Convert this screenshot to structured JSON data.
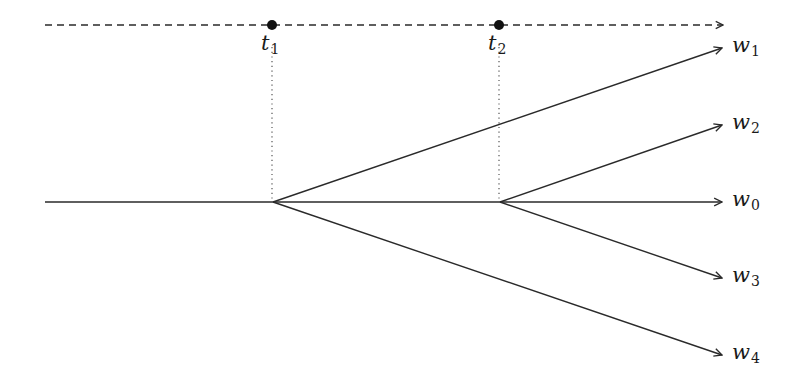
{
  "diagram": {
    "type": "branching-timeline",
    "colors": {
      "stroke": "#2a2a2a",
      "background": "#ffffff",
      "dot": "#111111"
    },
    "timeline": {
      "style": "dashed",
      "y": 25,
      "x_start": 45,
      "x_end": 723,
      "events": [
        {
          "id": "t1",
          "base": "t",
          "sub": "1",
          "x": 272
        },
        {
          "id": "t2",
          "base": "t",
          "sub": "2",
          "x": 499
        }
      ]
    },
    "trunk": {
      "x_start": 45,
      "x_end": 273,
      "y": 202
    },
    "branch_points": [
      {
        "id": "b1",
        "x": 273,
        "y": 202,
        "linked_event": "t1"
      },
      {
        "id": "b2",
        "x": 500,
        "y": 202,
        "linked_event": "t2"
      }
    ],
    "branches": [
      {
        "id": "w1",
        "base": "w",
        "sub": "1",
        "from": "b1",
        "x_end": 722,
        "y_end": 48
      },
      {
        "id": "w2",
        "base": "w",
        "sub": "2",
        "from": "b2",
        "x_end": 722,
        "y_end": 125
      },
      {
        "id": "w0",
        "base": "w",
        "sub": "0",
        "from": "b2",
        "x_end": 722,
        "y_end": 202
      },
      {
        "id": "w3",
        "base": "w",
        "sub": "3",
        "from": "b2",
        "x_end": 722,
        "y_end": 278
      },
      {
        "id": "w4",
        "base": "w",
        "sub": "4",
        "from": "b1",
        "x_end": 722,
        "y_end": 355
      }
    ],
    "extra_segments": [
      {
        "id": "trunk-b1-b2",
        "x1": 273,
        "y1": 202,
        "x2": 500,
        "y2": 202
      }
    ]
  }
}
